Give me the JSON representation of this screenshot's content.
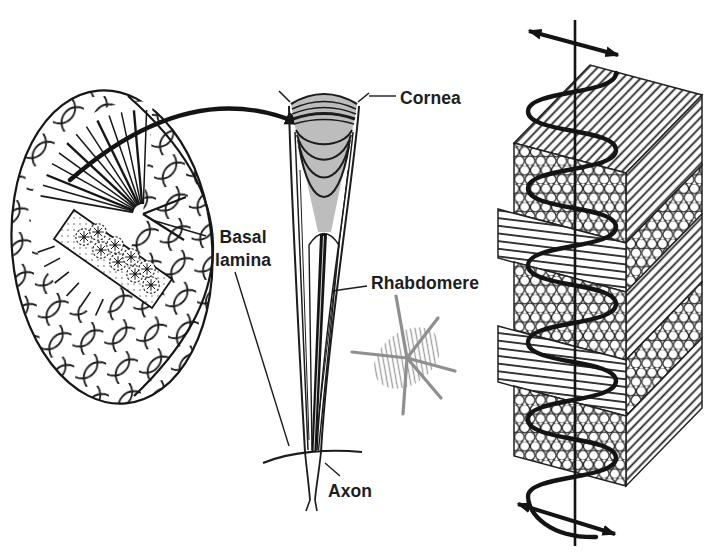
{
  "page": {
    "background": "#ffffff",
    "width_px": 706,
    "height_px": 557
  },
  "figure": {
    "labels": {
      "cornea": "Cornea",
      "basal_lamina": "Basal lamina",
      "rhabdomere": "Rhabdomere",
      "axon": "Axon"
    },
    "colors": {
      "ink": "#1a1a1a",
      "cone_gray": "#bdbdbd",
      "annotation_gray": "#8f8f8f",
      "background": "#ffffff"
    },
    "parts": [
      "compound-eye-cutaway",
      "magnify-arrow",
      "ommatidium-longitudinal-section",
      "rhabdomere-cross-section",
      "microvilli-stack",
      "light-ray-axis",
      "light-wave",
      "polarization-double-arrows"
    ]
  }
}
